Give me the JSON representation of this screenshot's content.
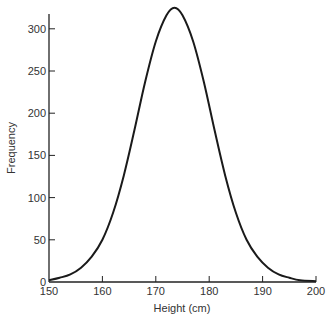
{
  "chart_data": {
    "type": "line",
    "title": "",
    "xlabel": "Height (cm)",
    "ylabel": "Frequency",
    "xlim": [
      150,
      200
    ],
    "ylim": [
      0,
      320
    ],
    "xticks": [
      150,
      160,
      170,
      180,
      190,
      200
    ],
    "yticks": [
      0,
      50,
      100,
      150,
      200,
      250,
      300
    ],
    "grid": false,
    "legend": null,
    "series": [
      {
        "name": "Height distribution",
        "x": [
          150,
          152,
          154,
          156,
          158,
          160,
          162,
          164,
          166,
          168,
          170,
          172,
          173.5,
          175,
          177,
          179,
          181,
          183,
          185,
          187,
          189,
          191,
          193,
          195,
          197,
          200
        ],
        "y": [
          2,
          5,
          9,
          17,
          30,
          50,
          82,
          126,
          180,
          237,
          285,
          316,
          325,
          316,
          285,
          237,
          180,
          126,
          82,
          50,
          30,
          17,
          9,
          5,
          2,
          1
        ]
      }
    ],
    "annotations": []
  },
  "axes": {
    "x_label": "Height (cm)",
    "y_label": "Frequency",
    "x_ticks": [
      "150",
      "160",
      "170",
      "180",
      "190",
      "200"
    ],
    "y_ticks": [
      "0",
      "50",
      "100",
      "150",
      "200",
      "250",
      "300"
    ]
  },
  "colors": {
    "line": "#1a1a1a",
    "axis": "#222222",
    "text": "#333333"
  }
}
